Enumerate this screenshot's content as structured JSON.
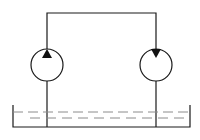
{
  "diagram": {
    "type": "hydraulic-circuit",
    "background": "#ffffff",
    "stroke_color": "#1a1a1a",
    "dash_color": "#8c8c8c",
    "components": [
      {
        "id": "pump",
        "kind": "hydraulic-pump",
        "center": [
          47,
          65
        ],
        "radius": 16,
        "arrow_direction": "up"
      },
      {
        "id": "motor",
        "kind": "hydraulic-motor",
        "center": [
          156,
          65
        ],
        "radius": 16,
        "arrow_direction": "down"
      },
      {
        "id": "tank",
        "kind": "reservoir",
        "left": 13,
        "right": 190,
        "top": 105,
        "bottom": 127
      }
    ],
    "connections": [
      {
        "from": "pump",
        "to": "motor",
        "route": "top-line",
        "y": 13
      },
      {
        "from": "tank",
        "to": "pump",
        "route": "suction-line"
      },
      {
        "from": "motor",
        "to": "tank",
        "route": "return-line"
      }
    ]
  }
}
